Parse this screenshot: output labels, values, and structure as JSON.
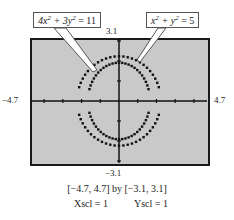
{
  "chart_data": {
    "type": "line",
    "title": "",
    "series": [
      {
        "name": "4x^2 + 3y^2 = 11",
        "kind": "ellipse",
        "a": 1.658,
        "b": 1.915
      },
      {
        "name": "x^2 + y^2 = 5",
        "kind": "circle",
        "r": 2.236
      }
    ],
    "xlim": [
      -4.7,
      4.7
    ],
    "ylim": [
      -3.1,
      3.1
    ],
    "xscl": 1,
    "yscl": 1,
    "grid": false,
    "xlabel": "",
    "ylabel": ""
  },
  "labels": {
    "ymax": "3.1",
    "ymin": "−3.1",
    "xmin": "−4.7",
    "xmax": "4.7"
  },
  "callouts": {
    "ellipse": {
      "pre": "4x",
      "sup1": "2",
      "mid": " + 3y",
      "sup2": "2",
      "post": " = 11"
    },
    "circle": {
      "pre": "x",
      "sup1": "2",
      "mid": " + y",
      "sup2": "2",
      "post": " = 5"
    }
  },
  "caption": {
    "window": "[−4.7, 4.7]  by  [−3.1, 3.1]",
    "xscl": "Xscl = 1",
    "yscl": "Yscl = 1"
  }
}
